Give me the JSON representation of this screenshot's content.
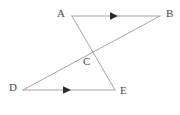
{
  "figure": {
    "type": "geometry-diagram",
    "background_color": "#ffffff",
    "line_color": "#9a9a9a",
    "label_color": "#4a4a4a",
    "arrow_color": "#2b2b2b",
    "canvas": {
      "width": 180,
      "height": 115
    },
    "points": [
      {
        "id": "A",
        "label": "A",
        "x": 72,
        "y": 16,
        "label_x": 57,
        "label_y": 8
      },
      {
        "id": "B",
        "label": "B",
        "x": 160,
        "y": 16,
        "label_x": 166,
        "label_y": 8
      },
      {
        "id": "C",
        "label": "C",
        "x": 88,
        "y": 54,
        "label_x": 83,
        "label_y": 56
      },
      {
        "id": "D",
        "label": "D",
        "x": 23,
        "y": 90,
        "label_x": 9,
        "label_y": 82
      },
      {
        "id": "E",
        "label": "E",
        "x": 115,
        "y": 90,
        "label_x": 120,
        "label_y": 85
      }
    ],
    "segments": [
      {
        "id": "AB",
        "name": "segment-ab",
        "from": "A",
        "to": "B",
        "x1": 72,
        "y1": 16,
        "x2": 160,
        "y2": 16,
        "arrow": true
      },
      {
        "id": "AE",
        "name": "segment-ae",
        "from": "A",
        "to": "E",
        "x1": 72,
        "y1": 16,
        "x2": 115,
        "y2": 90,
        "arrow": false
      },
      {
        "id": "DB",
        "name": "segment-db",
        "from": "D",
        "to": "B",
        "x1": 23,
        "y1": 90,
        "x2": 160,
        "y2": 16,
        "arrow": false
      },
      {
        "id": "DE",
        "name": "segment-de",
        "from": "D",
        "to": "E",
        "x1": 23,
        "y1": 90,
        "x2": 115,
        "y2": 90,
        "arrow": true
      }
    ],
    "arrow_markers": [
      {
        "id": "arrow-ab",
        "name": "arrow-marker-ab",
        "on_segment": "AB",
        "x": 117,
        "y": 16,
        "direction": "right"
      },
      {
        "id": "arrow-de",
        "name": "arrow-marker-de",
        "on_segment": "DE",
        "x": 70,
        "y": 90,
        "direction": "right"
      }
    ]
  }
}
